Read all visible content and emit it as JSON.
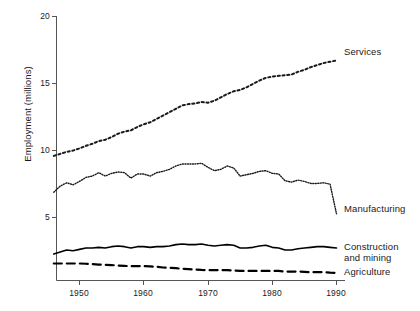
{
  "chart_data": {
    "type": "line",
    "title": "",
    "xlabel": "",
    "ylabel": "Employment (millions)",
    "xlim": [
      1946,
      1991
    ],
    "ylim": [
      0,
      20
    ],
    "grid": false,
    "legend_position": "right-inline-labels",
    "x_ticks": [
      1950,
      1960,
      1970,
      1980,
      1990
    ],
    "y_ticks": [
      5,
      10,
      15,
      20
    ],
    "x": [
      1946,
      1947,
      1948,
      1949,
      1950,
      1951,
      1952,
      1953,
      1954,
      1955,
      1956,
      1957,
      1958,
      1959,
      1960,
      1961,
      1962,
      1963,
      1964,
      1965,
      1966,
      1967,
      1968,
      1969,
      1970,
      1971,
      1972,
      1973,
      1974,
      1975,
      1976,
      1977,
      1978,
      1979,
      1980,
      1981,
      1982,
      1983,
      1984,
      1985,
      1986,
      1987,
      1988,
      1989,
      1990
    ],
    "series": [
      {
        "name": "Services",
        "style": "dotted-coarse",
        "color": "#1a1a1a",
        "values": [
          9.6,
          9.75,
          9.9,
          10.0,
          10.15,
          10.35,
          10.5,
          10.7,
          10.8,
          11.0,
          11.25,
          11.4,
          11.5,
          11.75,
          11.95,
          12.1,
          12.35,
          12.6,
          12.85,
          13.1,
          13.35,
          13.45,
          13.5,
          13.6,
          13.55,
          13.7,
          13.95,
          14.2,
          14.4,
          14.5,
          14.7,
          14.95,
          15.2,
          15.4,
          15.5,
          15.55,
          15.6,
          15.65,
          15.85,
          16.0,
          16.2,
          16.35,
          16.5,
          16.6,
          16.7
        ]
      },
      {
        "name": "Manufacturing",
        "style": "dotted-fine",
        "color": "#1a1a1a",
        "values": [
          6.9,
          7.35,
          7.6,
          7.45,
          7.7,
          8.0,
          8.1,
          8.35,
          8.1,
          8.3,
          8.4,
          8.35,
          7.95,
          8.25,
          8.25,
          8.1,
          8.35,
          8.45,
          8.6,
          8.85,
          9.0,
          9.0,
          9.0,
          9.05,
          8.75,
          8.5,
          8.6,
          8.85,
          8.7,
          8.1,
          8.2,
          8.3,
          8.45,
          8.5,
          8.3,
          8.25,
          7.75,
          7.65,
          7.8,
          7.7,
          7.55,
          7.55,
          7.6,
          7.5,
          5.3
        ]
      },
      {
        "name": "Construction and mining",
        "style": "solid",
        "color": "#000000",
        "values": [
          2.3,
          2.45,
          2.6,
          2.55,
          2.65,
          2.75,
          2.75,
          2.8,
          2.75,
          2.85,
          2.9,
          2.85,
          2.75,
          2.85,
          2.85,
          2.8,
          2.85,
          2.85,
          2.9,
          3.0,
          3.05,
          3.0,
          3.0,
          3.05,
          2.95,
          2.9,
          2.95,
          3.0,
          2.95,
          2.75,
          2.75,
          2.8,
          2.9,
          2.95,
          2.8,
          2.75,
          2.6,
          2.6,
          2.7,
          2.75,
          2.8,
          2.85,
          2.85,
          2.8,
          2.75
        ]
      },
      {
        "name": "Agriculture",
        "style": "dashed",
        "color": "#000000",
        "values": [
          1.6,
          1.6,
          1.6,
          1.6,
          1.6,
          1.58,
          1.55,
          1.52,
          1.5,
          1.48,
          1.45,
          1.42,
          1.4,
          1.4,
          1.4,
          1.38,
          1.35,
          1.3,
          1.28,
          1.25,
          1.2,
          1.18,
          1.15,
          1.12,
          1.1,
          1.1,
          1.1,
          1.1,
          1.08,
          1.05,
          1.05,
          1.05,
          1.05,
          1.05,
          1.05,
          1.05,
          1.0,
          1.0,
          1.0,
          0.98,
          0.95,
          0.95,
          0.95,
          0.92,
          0.9
        ]
      }
    ]
  },
  "axis": {
    "y_tick_labels": [
      "20",
      "15",
      "10",
      "5"
    ],
    "x_tick_labels": [
      "1950",
      "1960",
      "1970",
      "1980",
      "1990"
    ],
    "y_axis_title": "Employment (millions)"
  },
  "labels": {
    "services": "Services",
    "manufacturing": "Manufacturing",
    "construction_line1": "Construction",
    "construction_line2": "and mining",
    "agriculture": "Agriculture"
  }
}
